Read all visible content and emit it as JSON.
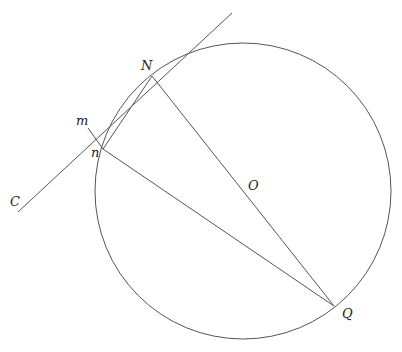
{
  "diagram": {
    "labels": {
      "N": "N",
      "m": "m",
      "n": "n",
      "C": "C",
      "O": "O",
      "Q": "Q"
    },
    "elements": [
      "circle centered at O",
      "tangent line through C and N",
      "diameter N to Q through O",
      "chord N to n",
      "segment m to n",
      "chord n to Q"
    ]
  }
}
